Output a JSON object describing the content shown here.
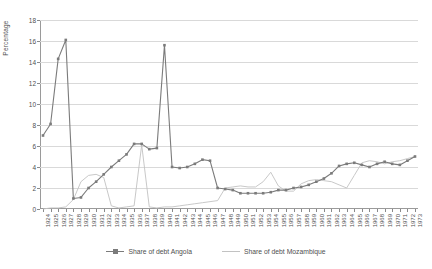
{
  "chart_data": {
    "type": "line",
    "title": "",
    "xlabel": "",
    "ylabel": "Percentage",
    "ylim": [
      0,
      18
    ],
    "ytick_step": 2,
    "yticks": [
      0,
      2,
      4,
      6,
      8,
      10,
      12,
      14,
      16,
      18
    ],
    "grid": true,
    "legend_position": "bottom",
    "categories": [
      "1924",
      "1925",
      "1926",
      "1927",
      "1928",
      "1929",
      "1930",
      "1931",
      "1932",
      "1933",
      "1934",
      "1935",
      "1936",
      "1937",
      "1938",
      "1939",
      "1940",
      "1941",
      "1942",
      "1943",
      "1944",
      "1945",
      "1946",
      "1947",
      "1948",
      "1949",
      "1950",
      "1951",
      "1952",
      "1953",
      "1954",
      "1955",
      "1956",
      "1957",
      "1958",
      "1959",
      "1960",
      "1961",
      "1962",
      "1963",
      "1964",
      "1965",
      "1966",
      "1967",
      "1968",
      "1969",
      "1970",
      "1971",
      "1972",
      "1973"
    ],
    "series": [
      {
        "name": "Share of debt Angola",
        "color": "#7b7b7b",
        "marker": "square",
        "values": [
          7.0,
          8.1,
          14.3,
          16.1,
          1.0,
          1.1,
          2.0,
          2.6,
          3.3,
          4.0,
          4.6,
          5.2,
          6.2,
          6.2,
          5.7,
          5.8,
          15.6,
          4.0,
          3.9,
          4.0,
          4.3,
          4.7,
          4.6,
          2.0,
          1.9,
          1.8,
          1.5,
          1.5,
          1.5,
          1.5,
          1.6,
          1.8,
          1.8,
          2.0,
          2.1,
          2.3,
          2.6,
          2.9,
          3.4,
          4.1,
          4.3,
          4.4,
          4.2,
          4.0,
          4.3,
          4.5,
          4.3,
          4.2,
          4.6,
          5.0
        ]
      },
      {
        "name": "Share of debt Mozambique",
        "color": "#c2c2c2",
        "marker": "none",
        "values": [
          0.0,
          0.1,
          0.1,
          0.2,
          0.9,
          2.6,
          3.2,
          3.3,
          3.0,
          0.3,
          0.1,
          0.2,
          0.3,
          6.1,
          0.2,
          0.1,
          0.2,
          0.2,
          0.3,
          0.4,
          0.5,
          0.6,
          0.7,
          0.8,
          2.0,
          2.1,
          2.2,
          2.1,
          2.1,
          2.6,
          3.5,
          2.2,
          1.7,
          1.7,
          2.4,
          2.7,
          2.8,
          2.7,
          2.6,
          2.3,
          2.0,
          3.2,
          4.4,
          4.6,
          4.5,
          4.3,
          4.5,
          4.6,
          4.8,
          5.0
        ]
      }
    ]
  },
  "legend": {
    "items": [
      {
        "label": "Share of debt Angola"
      },
      {
        "label": "Share of debt Mozambique"
      }
    ]
  }
}
